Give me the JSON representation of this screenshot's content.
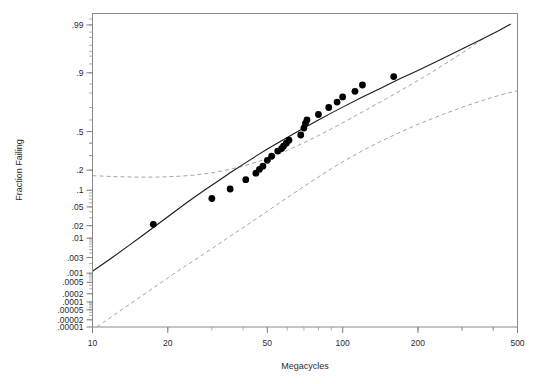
{
  "chart_data": {
    "type": "scatter",
    "title": "",
    "xlabel": "Megacycles",
    "ylabel": "Fraction Failing",
    "xscale": "log",
    "yscale": "lognormal-probability",
    "xlim": [
      10,
      500
    ],
    "ylim": [
      1e-05,
      0.995
    ],
    "grid": false,
    "legend": null,
    "x_tick_labels": [
      "10",
      "20",
      "50",
      "100",
      "200",
      "500"
    ],
    "x_tick_values": [
      10,
      20,
      50,
      100,
      200,
      500
    ],
    "y_tick_labels": [
      ".99",
      ".9",
      ".5",
      ".2",
      ".1",
      ".05",
      ".02",
      ".01",
      ".003",
      ".001",
      ".0005",
      ".0002",
      ".0001",
      ".00005",
      ".00002",
      ".00001"
    ],
    "y_tick_values": [
      0.99,
      0.9,
      0.5,
      0.2,
      0.1,
      0.05,
      0.02,
      0.01,
      0.003,
      0.001,
      0.0005,
      0.0002,
      0.0001,
      5e-05,
      2e-05,
      1e-05
    ],
    "series": [
      {
        "name": "Failure data",
        "type": "scatter",
        "marker": "filled-circle",
        "color": "#000000",
        "points": [
          {
            "x": 17.5,
            "y": 0.0215
          },
          {
            "x": 30.0,
            "y": 0.072
          },
          {
            "x": 35.5,
            "y": 0.105
          },
          {
            "x": 41.0,
            "y": 0.147
          },
          {
            "x": 45.0,
            "y": 0.182
          },
          {
            "x": 46.5,
            "y": 0.205
          },
          {
            "x": 48.0,
            "y": 0.225
          },
          {
            "x": 50.0,
            "y": 0.265
          },
          {
            "x": 52.0,
            "y": 0.295
          },
          {
            "x": 55.0,
            "y": 0.335
          },
          {
            "x": 57.0,
            "y": 0.355
          },
          {
            "x": 58.0,
            "y": 0.375
          },
          {
            "x": 59.5,
            "y": 0.4
          },
          {
            "x": 61.0,
            "y": 0.425
          },
          {
            "x": 68.0,
            "y": 0.47
          },
          {
            "x": 70.0,
            "y": 0.53
          },
          {
            "x": 71.0,
            "y": 0.57
          },
          {
            "x": 72.0,
            "y": 0.6
          },
          {
            "x": 80.0,
            "y": 0.645
          },
          {
            "x": 88.0,
            "y": 0.7
          },
          {
            "x": 95.0,
            "y": 0.74
          },
          {
            "x": 100.0,
            "y": 0.775
          },
          {
            "x": 112.0,
            "y": 0.81
          },
          {
            "x": 120.0,
            "y": 0.845
          },
          {
            "x": 160.0,
            "y": 0.885
          }
        ]
      },
      {
        "name": "Lognormal fit",
        "type": "line",
        "style": "solid",
        "color": "#1a1a1a",
        "points": [
          {
            "x": 10.0,
            "y": 0.00115
          },
          {
            "x": 12.0,
            "y": 0.003
          },
          {
            "x": 14.0,
            "y": 0.0065
          },
          {
            "x": 16.0,
            "y": 0.0122
          },
          {
            "x": 18.0,
            "y": 0.0205
          },
          {
            "x": 20.0,
            "y": 0.0315
          },
          {
            "x": 24.0,
            "y": 0.062
          },
          {
            "x": 28.0,
            "y": 0.1
          },
          {
            "x": 32.0,
            "y": 0.143
          },
          {
            "x": 36.0,
            "y": 0.19
          },
          {
            "x": 40.0,
            "y": 0.237
          },
          {
            "x": 45.0,
            "y": 0.296
          },
          {
            "x": 50.0,
            "y": 0.351
          },
          {
            "x": 55.0,
            "y": 0.401
          },
          {
            "x": 60.0,
            "y": 0.449
          },
          {
            "x": 70.0,
            "y": 0.531
          },
          {
            "x": 80.0,
            "y": 0.599
          },
          {
            "x": 90.0,
            "y": 0.656
          },
          {
            "x": 100.0,
            "y": 0.703
          },
          {
            "x": 120.0,
            "y": 0.774
          },
          {
            "x": 140.0,
            "y": 0.824
          },
          {
            "x": 170.0,
            "y": 0.876
          },
          {
            "x": 200.0,
            "y": 0.909
          },
          {
            "x": 250.0,
            "y": 0.944
          },
          {
            "x": 300.0,
            "y": 0.964
          },
          {
            "x": 360.0,
            "y": 0.978
          },
          {
            "x": 420.0,
            "y": 0.986
          },
          {
            "x": 470.0,
            "y": 0.9905
          }
        ]
      },
      {
        "name": "Upper confidence bound",
        "type": "line",
        "style": "dashed",
        "color": "#9a9a9a",
        "points": [
          {
            "x": 10.0,
            "y": 0.168
          },
          {
            "x": 12.0,
            "y": 0.163
          },
          {
            "x": 15.0,
            "y": 0.16
          },
          {
            "x": 18.0,
            "y": 0.16
          },
          {
            "x": 22.0,
            "y": 0.164
          },
          {
            "x": 26.0,
            "y": 0.172
          },
          {
            "x": 30.0,
            "y": 0.184
          },
          {
            "x": 35.0,
            "y": 0.203
          },
          {
            "x": 40.0,
            "y": 0.225
          },
          {
            "x": 46.0,
            "y": 0.256
          },
          {
            "x": 52.0,
            "y": 0.291
          },
          {
            "x": 60.0,
            "y": 0.34
          },
          {
            "x": 70.0,
            "y": 0.403
          },
          {
            "x": 80.0,
            "y": 0.465
          },
          {
            "x": 90.0,
            "y": 0.523
          },
          {
            "x": 100.0,
            "y": 0.575
          },
          {
            "x": 115.0,
            "y": 0.645
          },
          {
            "x": 130.0,
            "y": 0.703
          },
          {
            "x": 150.0,
            "y": 0.765
          },
          {
            "x": 170.0,
            "y": 0.813
          },
          {
            "x": 195.0,
            "y": 0.86
          },
          {
            "x": 220.0,
            "y": 0.894
          },
          {
            "x": 250.0,
            "y": 0.925
          },
          {
            "x": 280.0,
            "y": 0.946
          },
          {
            "x": 310.0,
            "y": 0.961
          },
          {
            "x": 340.0,
            "y": 0.972
          },
          {
            "x": 370.0,
            "y": 0.98
          }
        ]
      },
      {
        "name": "Lower confidence bound",
        "type": "line",
        "style": "dashed",
        "color": "#9a9a9a",
        "points": [
          {
            "x": 10.4,
            "y": 1e-05
          },
          {
            "x": 11.5,
            "y": 2.05e-05
          },
          {
            "x": 13.0,
            "y": 4.8e-05
          },
          {
            "x": 15.0,
            "y": 0.000125
          },
          {
            "x": 17.0,
            "y": 0.00027
          },
          {
            "x": 19.0,
            "y": 0.00052
          },
          {
            "x": 22.0,
            "y": 0.00118
          },
          {
            "x": 25.0,
            "y": 0.00225
          },
          {
            "x": 28.0,
            "y": 0.00385
          },
          {
            "x": 32.0,
            "y": 0.0071
          },
          {
            "x": 36.0,
            "y": 0.0118
          },
          {
            "x": 40.0,
            "y": 0.018
          },
          {
            "x": 45.0,
            "y": 0.0282
          },
          {
            "x": 50.0,
            "y": 0.041
          },
          {
            "x": 56.0,
            "y": 0.06
          },
          {
            "x": 62.0,
            "y": 0.082
          },
          {
            "x": 70.0,
            "y": 0.115
          },
          {
            "x": 80.0,
            "y": 0.161
          },
          {
            "x": 90.0,
            "y": 0.208
          },
          {
            "x": 100.0,
            "y": 0.254
          },
          {
            "x": 120.0,
            "y": 0.338
          },
          {
            "x": 140.0,
            "y": 0.409
          },
          {
            "x": 170.0,
            "y": 0.495
          },
          {
            "x": 200.0,
            "y": 0.562
          },
          {
            "x": 250.0,
            "y": 0.644
          },
          {
            "x": 300.0,
            "y": 0.701
          },
          {
            "x": 360.0,
            "y": 0.75
          },
          {
            "x": 420.0,
            "y": 0.784
          },
          {
            "x": 470.0,
            "y": 0.804
          },
          {
            "x": 500.0,
            "y": 0.813
          }
        ]
      }
    ]
  }
}
